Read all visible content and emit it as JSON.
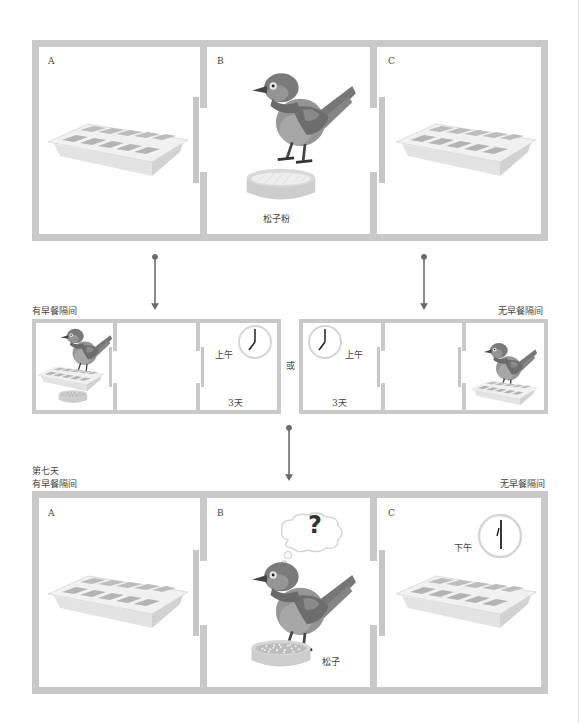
{
  "diagram": {
    "type": "experiment-flow",
    "colors": {
      "wall": "#c9c9c9",
      "bird_dark": "#6e6e6e",
      "bird_mid": "#8d8d8d",
      "bird_light": "#a9a9a9",
      "tray": "#e9e9e9",
      "arrow": "#6a6a6a"
    }
  },
  "top_stage": {
    "rooms": [
      {
        "letter": "A",
        "content": "caching-tray"
      },
      {
        "letter": "B",
        "content": "bird-and-bowl",
        "bowl_label": "松子粉"
      },
      {
        "letter": "C",
        "content": "caching-tray"
      }
    ]
  },
  "training": {
    "left": {
      "title": "有早餐隔间",
      "time_label": "上午",
      "days_label": "3天"
    },
    "or_label": "或",
    "right": {
      "title": "无早餐隔间",
      "time_label": "上午",
      "days_label": "3天"
    }
  },
  "test_stage": {
    "day_label": "第七天",
    "left_title": "有早餐隔间",
    "right_title": "无早餐隔间",
    "rooms": [
      {
        "letter": "A",
        "content": "caching-tray"
      },
      {
        "letter": "B",
        "content": "bird-thinking",
        "thought": "?",
        "bowl_label": "松子"
      },
      {
        "letter": "C",
        "content": "caching-tray",
        "time_label": "下午"
      }
    ]
  }
}
